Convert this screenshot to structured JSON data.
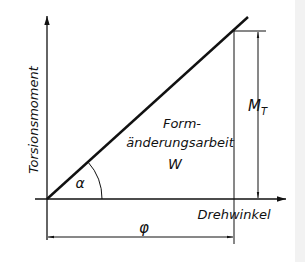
{
  "diagram": {
    "y_axis_label": "Torsionsmoment",
    "x_axis_label": "Drehwinkel",
    "area_label_line1": "Form-",
    "area_label_line2": "änderungsarbeit",
    "area_symbol": "W",
    "angle_symbol": "α",
    "moment_symbol": "M",
    "moment_subscript": "T",
    "angle_dimension_symbol": "φ"
  },
  "colors": {
    "line": "#111111",
    "background": "#ffffff",
    "edge_strip": "#f2f2f2"
  }
}
